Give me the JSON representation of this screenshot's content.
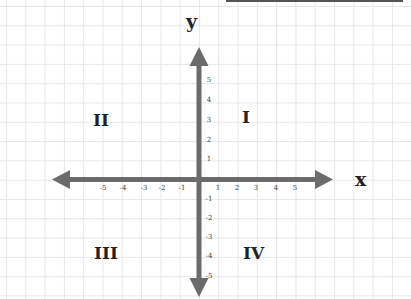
{
  "diagram": {
    "type": "cartesian-coordinate-plane",
    "axes": {
      "x": {
        "label": "x",
        "ticks": [
          "-5",
          "-4",
          "-3",
          "-2",
          "-1",
          "1",
          "2",
          "3",
          "4",
          "5"
        ]
      },
      "y": {
        "label": "y",
        "ticks": [
          "5",
          "4",
          "3",
          "2",
          "1",
          "-1",
          "-2",
          "-3",
          "-4",
          "-5"
        ]
      }
    },
    "quadrants": {
      "q1": "I",
      "q2": "II",
      "q3": "III",
      "q4": "IV"
    },
    "colors": {
      "axis": "#6b6b6b",
      "grid": "#e6e6e6",
      "label": "#222222",
      "background": "#ffffff"
    }
  }
}
